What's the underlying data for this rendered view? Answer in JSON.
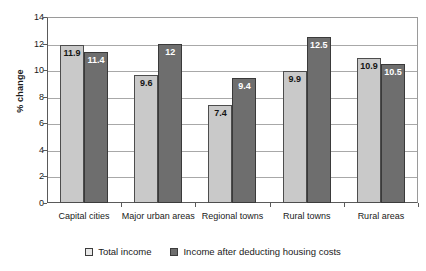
{
  "chart_data": {
    "type": "bar",
    "title": "",
    "xlabel": "",
    "ylabel": "% change",
    "ylim": [
      0,
      14
    ],
    "ytick_step": 2,
    "yticks": [
      "14",
      "12",
      "10",
      "8",
      "6",
      "4",
      "2",
      "0"
    ],
    "grid": true,
    "legend_position": "bottom",
    "categories": [
      "Capital cities",
      "Major urban areas",
      "Regional towns",
      "Rural towns",
      "Rural areas"
    ],
    "series": [
      {
        "name": "Total income",
        "color": "#c9c9c9",
        "values": [
          11.9,
          9.6,
          7.4,
          9.9,
          10.9
        ],
        "labels": [
          "11.9",
          "9.6",
          "7.4",
          "9.9",
          "10.9"
        ]
      },
      {
        "name": "Income after deducting housing costs",
        "color": "#6e6e6e",
        "values": [
          11.4,
          12.0,
          9.4,
          12.5,
          10.5
        ],
        "labels": [
          "11.4",
          "12",
          "9.4",
          "12.5",
          "10.5"
        ]
      }
    ]
  },
  "legend": {
    "items": [
      {
        "label": "Total income",
        "swatch": "light"
      },
      {
        "label": "Income after deducting housing costs",
        "swatch": "dark"
      }
    ]
  },
  "axis": {
    "y_label": "% change"
  }
}
